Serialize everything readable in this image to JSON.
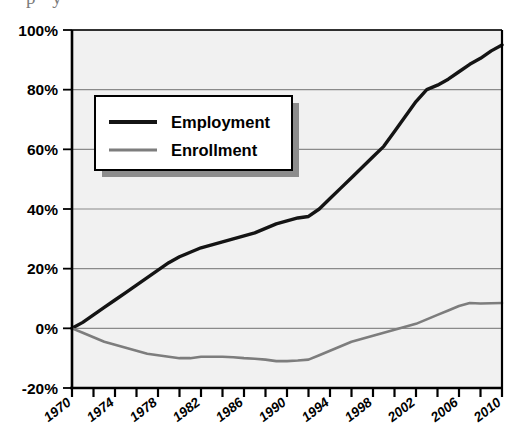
{
  "title_fragment": "p y",
  "colors": {
    "employment_line": "#141414",
    "enrollment_line": "#7d7d7d",
    "plot_background": "#f1f1f1",
    "gridline": "#8a8a8a",
    "axis": "#000000",
    "legend_background": "#ffffff",
    "legend_border": "#000000",
    "legend_shadow": "#8c8c8c",
    "page_background": "#ffffff"
  },
  "legend": {
    "position": "upper-left-inside",
    "entries": [
      {
        "label": "Employment",
        "color": "#141414",
        "swatch_name": "employment-swatch"
      },
      {
        "label": "Enrollment",
        "color": "#7d7d7d",
        "swatch_name": "enrollment-swatch"
      }
    ]
  },
  "axes": {
    "y_tick_labels": [
      "100%",
      "80%",
      "60%",
      "40%",
      "20%",
      "0%",
      "-20%"
    ],
    "y_tick_values": [
      100,
      80,
      60,
      40,
      20,
      0,
      -20
    ],
    "x_tick_labels": [
      "1970",
      "1974",
      "1978",
      "1982",
      "1986",
      "1990",
      "1994",
      "1998",
      "2002",
      "2006",
      "2010"
    ],
    "x_tick_values": [
      1970,
      1974,
      1978,
      1982,
      1986,
      1990,
      1994,
      1998,
      2002,
      2006,
      2010
    ],
    "x_minor_interval": 2
  },
  "chart_data": {
    "type": "line",
    "title": "",
    "xlabel": "",
    "ylabel": "",
    "xlim": [
      1970,
      2010
    ],
    "ylim": [
      -20,
      100
    ],
    "grid": true,
    "legend_position": "upper left",
    "x": [
      1970,
      1971,
      1972,
      1973,
      1974,
      1975,
      1976,
      1977,
      1978,
      1979,
      1980,
      1981,
      1982,
      1983,
      1984,
      1985,
      1986,
      1987,
      1988,
      1989,
      1990,
      1991,
      1992,
      1993,
      1994,
      1995,
      1996,
      1997,
      1998,
      1999,
      2000,
      2001,
      2002,
      2003,
      2004,
      2005,
      2006,
      2007,
      2008,
      2009,
      2010
    ],
    "series": [
      {
        "name": "Employment",
        "color": "#141414",
        "values": [
          0,
          2,
          4.5,
          7,
          9.5,
          12,
          14.5,
          17,
          19.5,
          22,
          24,
          25.5,
          27,
          28,
          29,
          30,
          31,
          32,
          33.5,
          35,
          36,
          37,
          37.5,
          40,
          43.5,
          47,
          50.5,
          54,
          57.5,
          61,
          66,
          71,
          76,
          80,
          81.5,
          83.5,
          86,
          88.5,
          90.5,
          93,
          95
        ]
      },
      {
        "name": "Enrollment",
        "color": "#7d7d7d",
        "values": [
          0,
          -1.5,
          -3,
          -4.5,
          -5.5,
          -6.5,
          -7.5,
          -8.5,
          -9,
          -9.5,
          -10,
          -10,
          -9.5,
          -9.5,
          -9.5,
          -9.7,
          -10,
          -10.2,
          -10.5,
          -11,
          -11,
          -10.8,
          -10.5,
          -9,
          -7.5,
          -6,
          -4.5,
          -3.5,
          -2.5,
          -1.5,
          -0.5,
          0.5,
          1.5,
          3,
          4.5,
          6,
          7.5,
          8.5,
          8.3,
          8.4,
          8.5
        ]
      }
    ]
  },
  "plot_geometry": {
    "left": 72,
    "right": 502,
    "top": 30,
    "bottom": 388
  }
}
